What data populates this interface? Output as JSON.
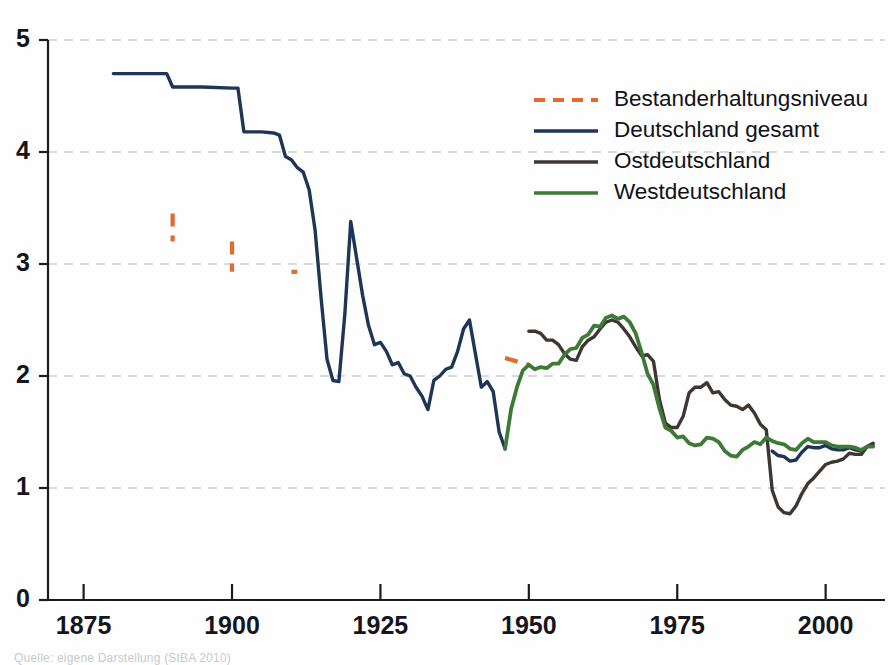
{
  "figure": {
    "title": "",
    "caption": "Quelle: eigene Darstellung (StBA 2010)"
  },
  "legend": {
    "position": "top-right",
    "items": [
      {
        "label": "Bestanderhaltungsniveau",
        "color": "#de6b2f",
        "style": "dashed",
        "key": "replacement"
      },
      {
        "label": "Deutschland gesamt",
        "color": "#1d3557",
        "style": "solid",
        "key": "germany_total"
      },
      {
        "label": "Ostdeutschland",
        "color": "#3f3634",
        "style": "solid",
        "key": "east_germany"
      },
      {
        "label": "Westdeutschland",
        "color": "#3d7a35",
        "style": "solid",
        "key": "west_germany"
      }
    ]
  },
  "axes": {
    "y_ticks": [
      "0",
      "1",
      "2",
      "3",
      "4",
      "5"
    ],
    "x_ticks": [
      "1875",
      "1900",
      "1925",
      "1950",
      "1975",
      "2000"
    ]
  },
  "chart_data": {
    "type": "line",
    "title": "",
    "xlabel": "",
    "ylabel": "",
    "xlim": [
      1869,
      2010
    ],
    "ylim": [
      0,
      5
    ],
    "y_ticks": [
      0,
      1,
      2,
      3,
      4,
      5
    ],
    "x_ticks": [
      1875,
      1900,
      1925,
      1950,
      1975,
      2000
    ],
    "grid": "horizontal-dashed",
    "legend_position": "top-right",
    "series": [
      {
        "name": "Bestanderhaltungsniveau",
        "color": "#de6b2f",
        "style": "dashed",
        "points": [
          [
            1881,
            3.45
          ],
          [
            1890,
            3.45
          ],
          [
            1890,
            3.2
          ],
          [
            1900,
            3.2
          ],
          [
            1900,
            2.93
          ],
          [
            1910,
            2.93
          ],
          [
            1911,
            2.93
          ],
          [
            1920,
            2.72
          ],
          [
            1930,
            2.52
          ],
          [
            1940,
            2.3
          ],
          [
            1946,
            2.16
          ],
          [
            1950,
            2.1
          ],
          [
            1960,
            2.1
          ],
          [
            1970,
            2.1
          ],
          [
            1980,
            2.1
          ],
          [
            1990,
            2.1
          ],
          [
            2000,
            2.1
          ],
          [
            2008,
            2.1
          ]
        ]
      },
      {
        "name": "Deutschland gesamt",
        "color": "#1d3557",
        "style": "solid",
        "points": [
          [
            1871,
            4.7
          ],
          [
            1880,
            4.7
          ],
          [
            1885,
            4.7
          ],
          [
            1889,
            4.7
          ],
          [
            1890,
            4.58
          ],
          [
            1895,
            4.58
          ],
          [
            1900,
            4.57
          ],
          [
            1901,
            4.57
          ],
          [
            1902,
            4.18
          ],
          [
            1905,
            4.18
          ],
          [
            1907,
            4.17
          ],
          [
            1908,
            4.15
          ],
          [
            1909,
            3.96
          ],
          [
            1910,
            3.93
          ],
          [
            1911,
            3.86
          ],
          [
            1912,
            3.82
          ],
          [
            1913,
            3.66
          ],
          [
            1914,
            3.3
          ],
          [
            1915,
            2.7
          ],
          [
            1916,
            2.15
          ],
          [
            1917,
            1.96
          ],
          [
            1918,
            1.95
          ],
          [
            1919,
            2.55
          ],
          [
            1920,
            3.38
          ],
          [
            1921,
            3.05
          ],
          [
            1922,
            2.72
          ],
          [
            1923,
            2.45
          ],
          [
            1924,
            2.28
          ],
          [
            1925,
            2.3
          ],
          [
            1926,
            2.22
          ],
          [
            1927,
            2.1
          ],
          [
            1928,
            2.12
          ],
          [
            1929,
            2.02
          ],
          [
            1930,
            2.0
          ],
          [
            1931,
            1.9
          ],
          [
            1932,
            1.82
          ],
          [
            1933,
            1.7
          ],
          [
            1934,
            1.96
          ],
          [
            1935,
            2.0
          ],
          [
            1936,
            2.06
          ],
          [
            1937,
            2.08
          ],
          [
            1938,
            2.22
          ],
          [
            1939,
            2.42
          ],
          [
            1940,
            2.5
          ],
          [
            1941,
            2.2
          ],
          [
            1942,
            1.9
          ],
          [
            1943,
            1.95
          ],
          [
            1944,
            1.86
          ],
          [
            1945,
            1.5
          ],
          [
            1946,
            1.35
          ],
          [
            1991,
            1.33
          ],
          [
            1992,
            1.29
          ],
          [
            1993,
            1.28
          ],
          [
            1994,
            1.24
          ],
          [
            1995,
            1.25
          ],
          [
            1996,
            1.32
          ],
          [
            1997,
            1.37
          ],
          [
            1998,
            1.36
          ],
          [
            1999,
            1.36
          ],
          [
            2000,
            1.38
          ],
          [
            2001,
            1.35
          ],
          [
            2002,
            1.34
          ],
          [
            2003,
            1.34
          ],
          [
            2004,
            1.36
          ],
          [
            2005,
            1.34
          ],
          [
            2006,
            1.33
          ],
          [
            2007,
            1.37
          ],
          [
            2008,
            1.38
          ]
        ]
      },
      {
        "name": "Ostdeutschland",
        "color": "#3f3634",
        "style": "solid",
        "points": [
          [
            1950,
            2.4
          ],
          [
            1951,
            2.4
          ],
          [
            1952,
            2.38
          ],
          [
            1953,
            2.32
          ],
          [
            1954,
            2.32
          ],
          [
            1955,
            2.28
          ],
          [
            1956,
            2.2
          ],
          [
            1957,
            2.15
          ],
          [
            1958,
            2.14
          ],
          [
            1959,
            2.26
          ],
          [
            1960,
            2.32
          ],
          [
            1961,
            2.35
          ],
          [
            1962,
            2.42
          ],
          [
            1963,
            2.48
          ],
          [
            1964,
            2.5
          ],
          [
            1965,
            2.48
          ],
          [
            1966,
            2.42
          ],
          [
            1967,
            2.35
          ],
          [
            1968,
            2.26
          ],
          [
            1969,
            2.18
          ],
          [
            1970,
            2.19
          ],
          [
            1971,
            2.13
          ],
          [
            1972,
            1.79
          ],
          [
            1973,
            1.58
          ],
          [
            1974,
            1.54
          ],
          [
            1975,
            1.54
          ],
          [
            1976,
            1.64
          ],
          [
            1977,
            1.85
          ],
          [
            1978,
            1.9
          ],
          [
            1979,
            1.9
          ],
          [
            1980,
            1.94
          ],
          [
            1981,
            1.85
          ],
          [
            1982,
            1.86
          ],
          [
            1983,
            1.79
          ],
          [
            1984,
            1.74
          ],
          [
            1985,
            1.73
          ],
          [
            1986,
            1.7
          ],
          [
            1987,
            1.74
          ],
          [
            1988,
            1.67
          ],
          [
            1989,
            1.57
          ],
          [
            1990,
            1.52
          ],
          [
            1991,
            0.98
          ],
          [
            1992,
            0.83
          ],
          [
            1993,
            0.78
          ],
          [
            1994,
            0.77
          ],
          [
            1995,
            0.84
          ],
          [
            1996,
            0.95
          ],
          [
            1997,
            1.04
          ],
          [
            1998,
            1.09
          ],
          [
            1999,
            1.15
          ],
          [
            2000,
            1.21
          ],
          [
            2001,
            1.23
          ],
          [
            2002,
            1.24
          ],
          [
            2003,
            1.26
          ],
          [
            2004,
            1.31
          ],
          [
            2005,
            1.3
          ],
          [
            2006,
            1.3
          ],
          [
            2007,
            1.37
          ],
          [
            2008,
            1.4
          ]
        ]
      },
      {
        "name": "Westdeutschland",
        "color": "#3d7a35",
        "style": "solid",
        "points": [
          [
            1946,
            1.35
          ],
          [
            1947,
            1.7
          ],
          [
            1948,
            1.9
          ],
          [
            1949,
            2.05
          ],
          [
            1950,
            2.1
          ],
          [
            1951,
            2.06
          ],
          [
            1952,
            2.08
          ],
          [
            1953,
            2.07
          ],
          [
            1954,
            2.11
          ],
          [
            1955,
            2.11
          ],
          [
            1956,
            2.19
          ],
          [
            1957,
            2.24
          ],
          [
            1958,
            2.25
          ],
          [
            1959,
            2.34
          ],
          [
            1960,
            2.37
          ],
          [
            1961,
            2.45
          ],
          [
            1962,
            2.44
          ],
          [
            1963,
            2.52
          ],
          [
            1964,
            2.54
          ],
          [
            1965,
            2.51
          ],
          [
            1966,
            2.53
          ],
          [
            1967,
            2.48
          ],
          [
            1968,
            2.38
          ],
          [
            1969,
            2.21
          ],
          [
            1970,
            2.02
          ],
          [
            1971,
            1.92
          ],
          [
            1972,
            1.71
          ],
          [
            1973,
            1.54
          ],
          [
            1974,
            1.51
          ],
          [
            1975,
            1.45
          ],
          [
            1976,
            1.46
          ],
          [
            1977,
            1.4
          ],
          [
            1978,
            1.38
          ],
          [
            1979,
            1.39
          ],
          [
            1980,
            1.45
          ],
          [
            1981,
            1.44
          ],
          [
            1982,
            1.41
          ],
          [
            1983,
            1.33
          ],
          [
            1984,
            1.29
          ],
          [
            1985,
            1.28
          ],
          [
            1986,
            1.34
          ],
          [
            1987,
            1.37
          ],
          [
            1988,
            1.41
          ],
          [
            1989,
            1.39
          ],
          [
            1990,
            1.45
          ],
          [
            1991,
            1.42
          ],
          [
            1992,
            1.4
          ],
          [
            1993,
            1.39
          ],
          [
            1994,
            1.35
          ],
          [
            1995,
            1.34
          ],
          [
            1996,
            1.4
          ],
          [
            1997,
            1.44
          ],
          [
            1998,
            1.41
          ],
          [
            1999,
            1.41
          ],
          [
            2000,
            1.41
          ],
          [
            2001,
            1.38
          ],
          [
            2002,
            1.37
          ],
          [
            2003,
            1.37
          ],
          [
            2004,
            1.37
          ],
          [
            2005,
            1.36
          ],
          [
            2006,
            1.34
          ],
          [
            2007,
            1.37
          ],
          [
            2008,
            1.37
          ]
        ]
      }
    ]
  }
}
